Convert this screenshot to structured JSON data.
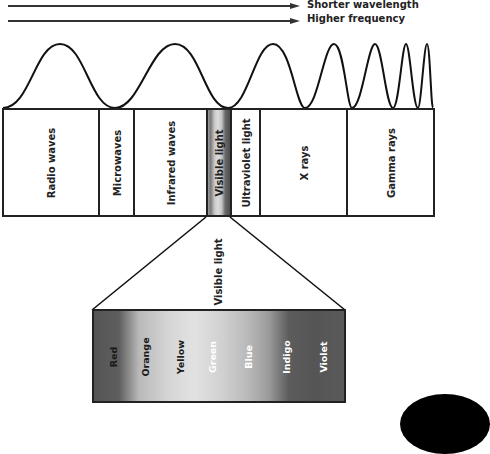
{
  "legend": {
    "arrows": [
      {
        "label": "Shorter wavelength"
      },
      {
        "label": "Higher frequency"
      }
    ]
  },
  "bands": [
    {
      "label": "Radio waves",
      "left": 2,
      "width": 96
    },
    {
      "label": "Microwaves",
      "left": 98,
      "width": 35
    },
    {
      "label": "Infrared waves",
      "left": 133,
      "width": 73
    },
    {
      "label": "Visible light",
      "left": 206,
      "width": 24
    },
    {
      "label": "Ultraviolet light",
      "left": 230,
      "width": 29
    },
    {
      "label": "X rays",
      "left": 259,
      "width": 87
    },
    {
      "label": "Gamma rays",
      "left": 346,
      "width": 89
    }
  ],
  "zoom_label": "Visible light",
  "visible_spectrum": {
    "colors": [
      {
        "label": "Red",
        "x": 113,
        "text_color": "#1a1a1a"
      },
      {
        "label": "Orange",
        "x": 145,
        "text_color": "#1a1a1a"
      },
      {
        "label": "Yellow",
        "x": 180,
        "text_color": "#1a1a1a"
      },
      {
        "label": "Green",
        "x": 212,
        "text_color": "#ffffff"
      },
      {
        "label": "Blue",
        "x": 248,
        "text_color": "#ffffff"
      },
      {
        "label": "Indigo",
        "x": 286,
        "text_color": "#ffffff"
      },
      {
        "label": "Violet",
        "x": 323,
        "text_color": "#ffffff"
      }
    ]
  },
  "colors": {
    "line": "#222222",
    "background": "#ffffff"
  }
}
